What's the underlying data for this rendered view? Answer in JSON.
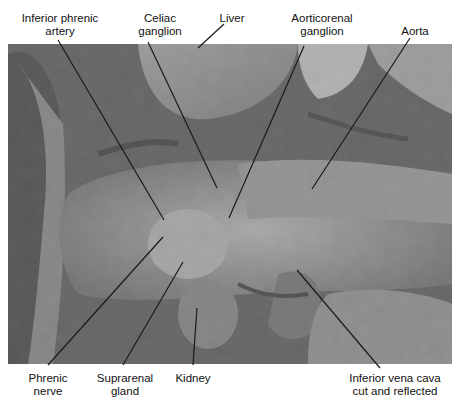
{
  "figure": {
    "type": "anatomical dissection photograph",
    "tone": "grayscale"
  },
  "labels": {
    "inferior_phrenic_artery": {
      "line1": "Inferior phrenic",
      "line2": "artery"
    },
    "celiac_ganglion": {
      "line1": "Celiac",
      "line2": "ganglion"
    },
    "liver": {
      "line1": "Liver"
    },
    "aorticorenal_ganglion": {
      "line1": "Aorticorenal",
      "line2": "ganglion"
    },
    "aorta": {
      "line1": "Aorta"
    },
    "phrenic_nerve": {
      "line1": "Phrenic",
      "line2": "nerve"
    },
    "suprarenal_gland": {
      "line1": "Suprarenal",
      "line2": "gland"
    },
    "kidney": {
      "line1": "Kidney"
    },
    "inferior_vena_cava": {
      "line1": "Inferior vena cava",
      "line2": "cut and reflected"
    }
  },
  "colors": {
    "label_text": "#111111",
    "leader_line": "#1a1a1a",
    "background": "#ffffff"
  }
}
